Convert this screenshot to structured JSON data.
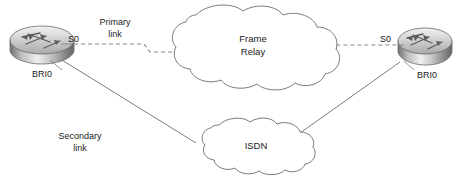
{
  "diagram": {
    "background_color": "#ffffff",
    "line_color": "#6e6e6e",
    "text_color": "#1a1a1a",
    "nodes": {
      "left_router": {
        "type": "router-icon",
        "interface_top_label": "S0",
        "interface_bottom_label": "BRI0"
      },
      "right_router": {
        "type": "router-icon",
        "interface_top_label": "S0",
        "interface_bottom_label": "BRI0"
      },
      "frame_relay_cloud": {
        "type": "network-cloud",
        "label_line1": "Frame",
        "label_line2": "Relay"
      },
      "isdn_cloud": {
        "type": "network-cloud",
        "label_line1": "ISDN"
      }
    },
    "links": {
      "primary": {
        "label_line1": "Primary",
        "label_line2": "link",
        "style": "dashed"
      },
      "secondary": {
        "label_line1": "Secondary",
        "label_line2": "link",
        "style": "solid"
      }
    }
  }
}
